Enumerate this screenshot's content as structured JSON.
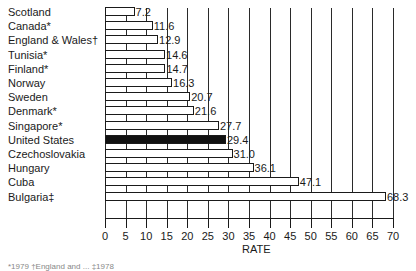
{
  "chart_data": {
    "type": "bar",
    "orientation": "horizontal",
    "title": "",
    "xlabel": "RATE",
    "ylabel": "",
    "xlim": [
      0,
      70
    ],
    "xticks": [
      0,
      5,
      10,
      15,
      20,
      25,
      30,
      35,
      40,
      45,
      50,
      55,
      60,
      65,
      70
    ],
    "grid": true,
    "legend": null,
    "highlight": "United States",
    "categories": [
      "Scotland",
      "Canada*",
      "England & Wales†",
      "Tunisia*",
      "Finland*",
      "Norway",
      "Sweden",
      "Denmark*",
      "Singapore*",
      "United States",
      "Czechoslovakia",
      "Hungary",
      "Cuba",
      "Bulgaria‡"
    ],
    "values": [
      7.2,
      11.6,
      12.9,
      14.6,
      14.7,
      16.3,
      20.7,
      21.6,
      27.7,
      29.4,
      31.0,
      36.1,
      47.1,
      68.3
    ],
    "value_labels": [
      "7.2",
      "11.6",
      "12.9",
      "14.6",
      "14.7",
      "16.3",
      "20.7",
      "21.6",
      "27.7",
      "29.4",
      "31.0",
      "36.1",
      "47.1",
      "68.3"
    ]
  },
  "colors": {
    "bar_fill": "#ffffff",
    "bar_highlight": "#111111",
    "ink": "#1a1a1a"
  },
  "footnote": "*1979        †England and ...        ‡1978"
}
